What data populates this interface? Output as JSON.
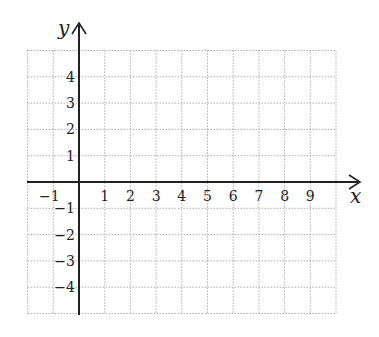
{
  "chart_data": {
    "type": "line",
    "title": "",
    "xlabel": "x",
    "ylabel": "y",
    "xlim": [
      -2,
      10
    ],
    "ylim": [
      -5,
      5
    ],
    "grid": true,
    "grid_style": "dotted",
    "x_ticks": [
      "-1",
      "1",
      "2",
      "3",
      "4",
      "5",
      "6",
      "7",
      "8",
      "9"
    ],
    "y_ticks": [
      "4",
      "3",
      "2",
      "1",
      "-1",
      "-2",
      "-3",
      "-4"
    ],
    "series": []
  },
  "colors": {
    "axis": "#222222",
    "grid": "#9a9a9a",
    "background": "#ffffff"
  }
}
